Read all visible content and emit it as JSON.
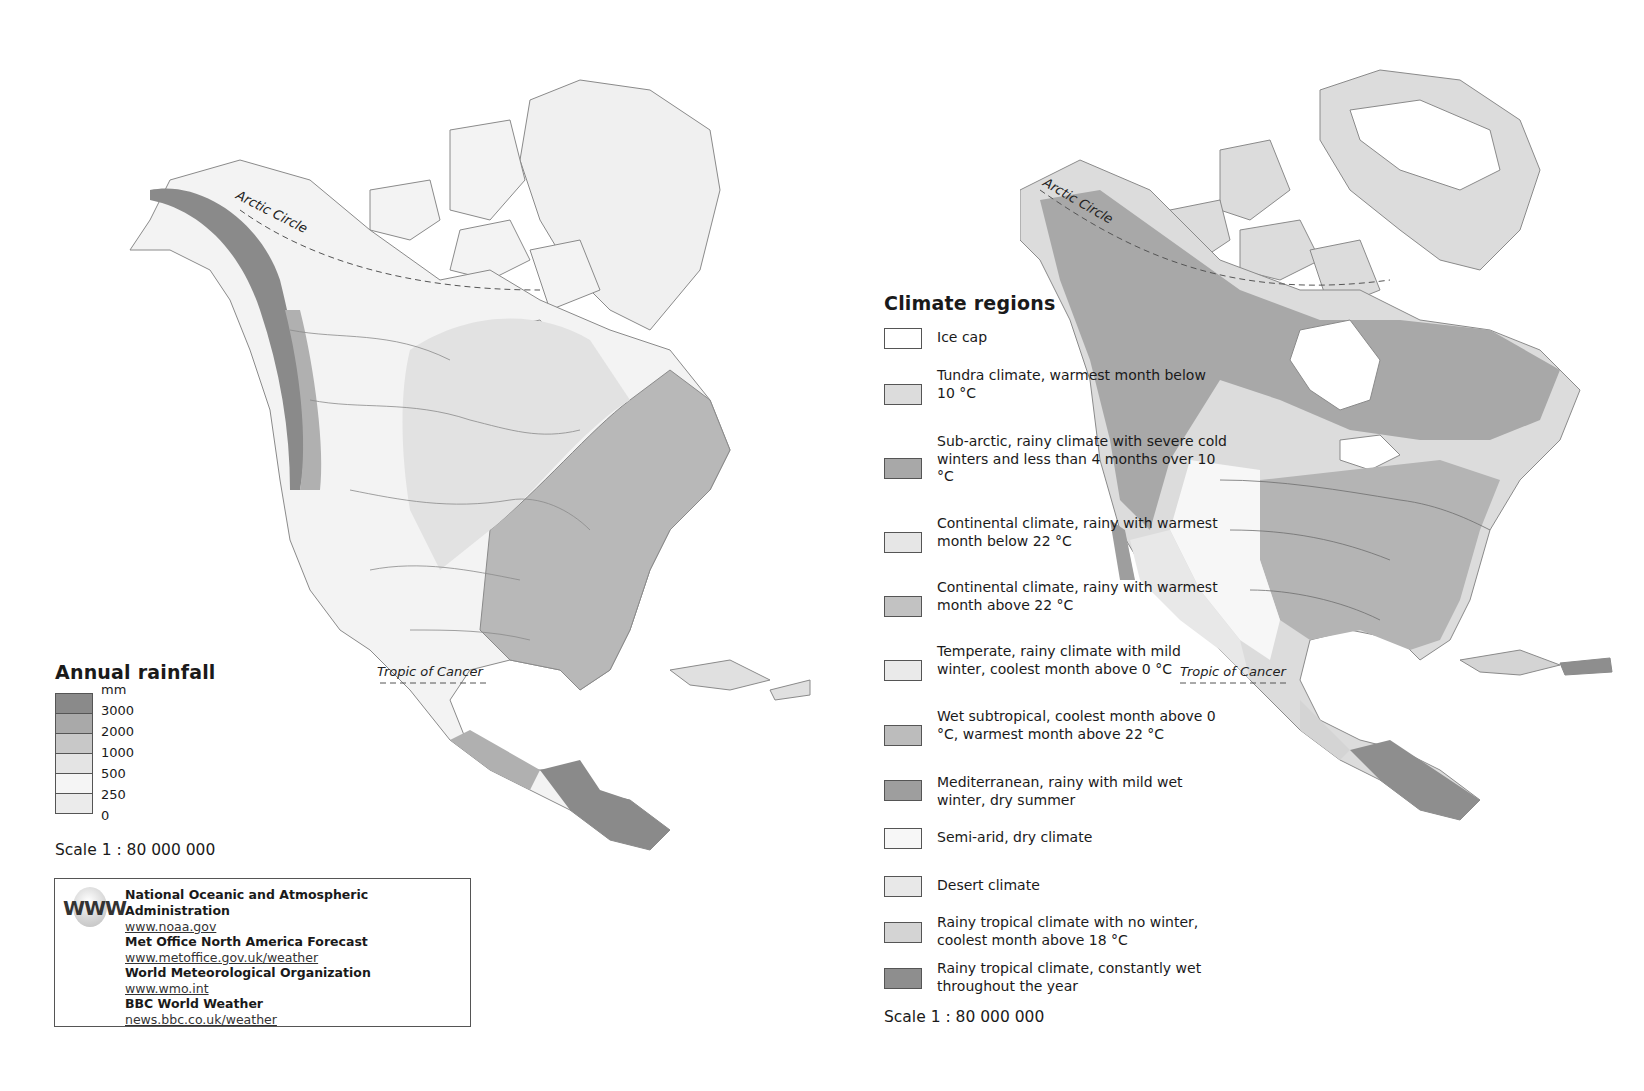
{
  "rainfall_map": {
    "title": "Annual rainfall",
    "unit": "mm",
    "legend": [
      {
        "label": "3000",
        "color": "#8a8a8a"
      },
      {
        "label": "2000",
        "color": "#a9a9a9"
      },
      {
        "label": "1000",
        "color": "#c8c8c8"
      },
      {
        "label": "500",
        "color": "#e4e4e4"
      },
      {
        "label": "250",
        "color": "#f5f5f5"
      },
      {
        "label": "0",
        "color": "#ebebeb"
      }
    ],
    "scale": "Scale 1 : 80 000 000",
    "labels": {
      "arctic_circle": "Arctic Circle",
      "tropic_of_cancer": "Tropic of Cancer"
    }
  },
  "links": {
    "icon": "www-globe-icon",
    "icon_text": "WWW",
    "items": [
      {
        "org": "National Oceanic and Atmospheric Administration",
        "url": "www.noaa.gov"
      },
      {
        "org": "Met Office North America Forecast",
        "url": "www.metoffice.gov.uk/weather"
      },
      {
        "org": "World Meteorological Organization",
        "url": "www.wmo.int"
      },
      {
        "org": "BBC World Weather",
        "url": "news.bbc.co.uk/weather"
      }
    ]
  },
  "climate_map": {
    "title": "Climate regions",
    "legend": [
      {
        "label": "Ice cap",
        "color": "#ffffff"
      },
      {
        "label": "Tundra climate, warmest month below 10 °C",
        "color": "#dcdcdc"
      },
      {
        "label": "Sub-arctic, rainy climate with severe cold winters and less than 4 months over 10 °C",
        "color": "#a8a8a8"
      },
      {
        "label": "Continental climate, rainy with warmest month below 22 °C",
        "color": "#e6e6e6"
      },
      {
        "label": "Continental climate, rainy with warmest month above 22 °C",
        "color": "#c2c2c2"
      },
      {
        "label": "Temperate, rainy climate with mild winter, coolest month above 0 °C",
        "color": "#eaeaea"
      },
      {
        "label": "Wet subtropical, coolest month above 0 °C, warmest month above 22 °C",
        "color": "#bcbcbc"
      },
      {
        "label": "Mediterranean, rainy with mild wet winter, dry summer",
        "color": "#9e9e9e"
      },
      {
        "label": "Semi-arid, dry climate",
        "color": "#f7f7f7"
      },
      {
        "label": "Desert climate",
        "color": "#e8e8e8"
      },
      {
        "label": "Rainy tropical climate with no winter, coolest month above 18 °C",
        "color": "#d4d4d4"
      },
      {
        "label": "Rainy tropical climate, constantly wet throughout the year",
        "color": "#8e8e8e"
      }
    ],
    "scale": "Scale 1 : 80 000 000",
    "labels": {
      "arctic_circle": "Arctic Circle",
      "tropic_of_cancer": "Tropic of Cancer"
    }
  }
}
